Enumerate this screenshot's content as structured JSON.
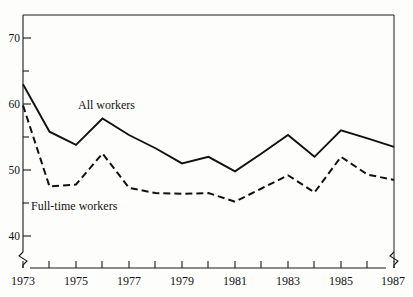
{
  "chart_data": {
    "type": "line",
    "title": "",
    "subtitle": "",
    "xlabel": "",
    "ylabel": "",
    "xlim": [
      1973,
      1987
    ],
    "ylim": [
      36.5,
      74
    ],
    "grid": false,
    "legend_position": "inline-annotations",
    "y_axis": {
      "major_ticks": [
        40,
        50,
        60,
        70
      ],
      "major_tick_labels": [
        "40",
        "50",
        "60",
        "70"
      ],
      "minor_ticks": [
        45,
        55,
        65
      ],
      "axis_break": true
    },
    "x_axis": {
      "ticks": [
        1973,
        1974,
        1975,
        1976,
        1977,
        1978,
        1979,
        1980,
        1981,
        1982,
        1983,
        1984,
        1985,
        1986,
        1987
      ],
      "tick_labels": [
        "1973",
        "",
        "1975",
        "",
        "1977",
        "",
        "1979",
        "",
        "1981",
        "",
        "1983",
        "",
        "1985",
        "",
        "1987"
      ],
      "labeled_ticks": [
        "1973",
        "1975",
        "1977",
        "1979",
        "1981",
        "1983",
        "1985",
        "1987"
      ],
      "axis_break": true
    },
    "x": [
      1973,
      1974,
      1975,
      1976,
      1977,
      1978,
      1979,
      1980,
      1981,
      1982,
      1983,
      1984,
      1985,
      1986,
      1987
    ],
    "series": [
      {
        "name": "All workers",
        "style": "solid",
        "color": "#111111",
        "label_x": 1976,
        "label_y": 61.5,
        "values": [
          63.0,
          55.8,
          53.8,
          57.8,
          55.3,
          53.3,
          51.0,
          52.0,
          49.8,
          52.5,
          55.3,
          52.0,
          56.0,
          54.8,
          53.5
        ]
      },
      {
        "name": "Full-time workers",
        "style": "dashed",
        "color": "#111111",
        "label_x": 1974.3,
        "label_y": 45.2,
        "values": [
          59.8,
          47.5,
          47.8,
          52.5,
          47.3,
          46.5,
          46.4,
          46.5,
          45.2,
          47.2,
          49.2,
          46.6,
          52.0,
          49.3,
          48.5
        ]
      }
    ],
    "annotations": [
      {
        "text": "All workers",
        "x": 1976,
        "y": 61.5
      },
      {
        "text": "Full-time workers",
        "x": 1974.3,
        "y": 45.2
      }
    ]
  },
  "labels": {
    "y_70": "70",
    "y_60": "60",
    "y_50": "50",
    "y_40": "40",
    "x_1973": "1973",
    "x_1975": "1975",
    "x_1977": "1977",
    "x_1979": "1979",
    "x_1981": "1981",
    "x_1983": "1983",
    "x_1985": "1985",
    "x_1987": "1987",
    "series_all": "All workers",
    "series_fulltime": "Full-time workers"
  }
}
